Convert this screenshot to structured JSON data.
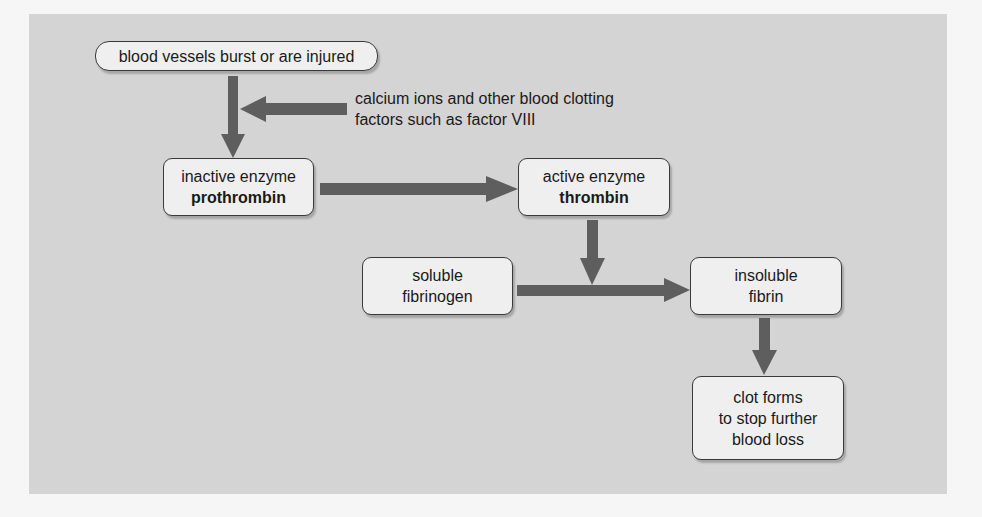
{
  "diagram": {
    "colors": {
      "background": "#f6f6f6",
      "panel": "#d4d4d4",
      "box_fill": "#efefef",
      "box_border": "#3a3a3a",
      "arrow": "#5e5e5e"
    },
    "nodes": {
      "injury": {
        "text": "blood vessels burst or are injured"
      },
      "cofactors": {
        "line1": "calcium ions and other blood clotting",
        "line2": "factors such as factor VIII"
      },
      "prothrombin": {
        "line1": "inactive enzyme",
        "line2": "prothrombin"
      },
      "thrombin": {
        "line1": "active enzyme",
        "line2": "thrombin"
      },
      "fibrinogen": {
        "line1": "soluble",
        "line2": "fibrinogen"
      },
      "fibrin": {
        "line1": "insoluble",
        "line2": "fibrin"
      },
      "clot": {
        "line1": "clot forms",
        "line2": "to stop further",
        "line3": "blood loss"
      }
    },
    "edges": [
      {
        "from": "injury",
        "to": "prothrombin"
      },
      {
        "from": "cofactors",
        "to": "injury->prothrombin"
      },
      {
        "from": "prothrombin",
        "to": "thrombin"
      },
      {
        "from": "thrombin",
        "to": "fibrinogen->fibrin"
      },
      {
        "from": "fibrinogen",
        "to": "fibrin"
      },
      {
        "from": "fibrin",
        "to": "clot"
      }
    ]
  }
}
